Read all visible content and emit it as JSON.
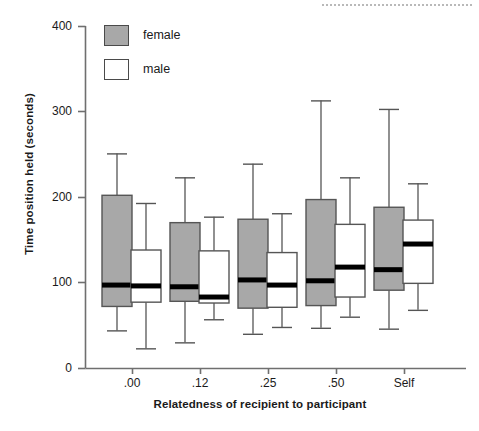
{
  "chart_data": {
    "type": "box",
    "title": "",
    "xlabel": "Relatedness of recipient to participant",
    "ylabel": "Time position held (seconds)",
    "categories": [
      ".00",
      ".12",
      ".25",
      ".50",
      "Self"
    ],
    "ylim": [
      0,
      400
    ],
    "yticks": [
      0,
      100,
      200,
      300,
      400
    ],
    "ytick_labels": [
      "0",
      "100",
      "200",
      "300",
      "400"
    ],
    "grid": false,
    "legend_position": "top-left",
    "series": [
      {
        "name": "female",
        "color": "#a8a8a8",
        "boxes": [
          {
            "category": ".00",
            "whisker_low": 44,
            "q1": 72,
            "median": 97,
            "q3": 202,
            "whisker_high": 251
          },
          {
            "category": ".12",
            "whisker_low": 30,
            "q1": 78,
            "median": 95,
            "q3": 170,
            "whisker_high": 223
          },
          {
            "category": ".25",
            "whisker_low": 40,
            "q1": 70,
            "median": 103,
            "q3": 174,
            "whisker_high": 239
          },
          {
            "category": ".50",
            "whisker_low": 47,
            "q1": 73,
            "median": 102,
            "q3": 197,
            "whisker_high": 313
          },
          {
            "category": "Self",
            "whisker_low": 46,
            "q1": 91,
            "median": 115,
            "q3": 188,
            "whisker_high": 303
          }
        ]
      },
      {
        "name": "male",
        "color": "#ffffff",
        "boxes": [
          {
            "category": ".00",
            "whisker_low": 23,
            "q1": 77,
            "median": 96,
            "q3": 138,
            "whisker_high": 193
          },
          {
            "category": ".12",
            "whisker_low": 57,
            "q1": 76,
            "median": 83,
            "q3": 137,
            "whisker_high": 177
          },
          {
            "category": ".25",
            "whisker_low": 48,
            "q1": 71,
            "median": 97,
            "q3": 135,
            "whisker_high": 181
          },
          {
            "category": ".50",
            "whisker_low": 60,
            "q1": 83,
            "median": 118,
            "q3": 168,
            "whisker_high": 223
          },
          {
            "category": "Self",
            "whisker_low": 68,
            "q1": 99,
            "median": 145,
            "q3": 173,
            "whisker_high": 216
          }
        ]
      }
    ]
  },
  "legend": {
    "items": [
      {
        "label": "female",
        "swatch": "female"
      },
      {
        "label": "male",
        "swatch": "male"
      }
    ]
  },
  "axis": {
    "y_label": "Time position held (seconds)",
    "x_label": "Relatedness of recipient to participant",
    "y_ticks": [
      "400",
      "300",
      "200",
      "100",
      "0"
    ],
    "x_ticks": [
      ".00",
      ".12",
      ".25",
      ".50",
      "Self"
    ]
  }
}
